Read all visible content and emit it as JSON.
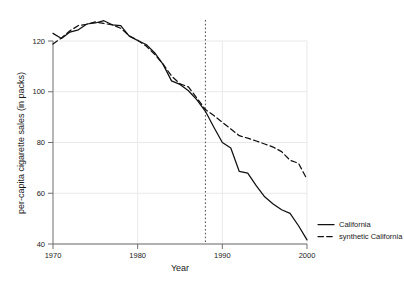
{
  "chart_data": {
    "type": "line",
    "title": "",
    "xlabel": "Year",
    "ylabel": "per-capita cigarette sales (in packs)",
    "xlim": [
      1970,
      2000
    ],
    "ylim": [
      40,
      130
    ],
    "xticks": [
      1970,
      1980,
      1990,
      2000
    ],
    "yticks": [
      40,
      60,
      80,
      100,
      120
    ],
    "grid": true,
    "legend_position": "right-bottom-outside",
    "x": [
      1970,
      1971,
      1972,
      1973,
      1974,
      1975,
      1976,
      1977,
      1978,
      1979,
      1980,
      1981,
      1982,
      1983,
      1984,
      1985,
      1986,
      1987,
      1988,
      1989,
      1990,
      1991,
      1992,
      1993,
      1994,
      1995,
      1996,
      1997,
      1998,
      1999,
      2000
    ],
    "series": [
      {
        "name": "California",
        "style": "solid",
        "color": "#111111",
        "values": [
          123.0,
          121.0,
          123.5,
          124.4,
          126.7,
          127.1,
          128.0,
          126.4,
          126.1,
          121.9,
          120.2,
          118.6,
          115.4,
          110.8,
          104.3,
          102.9,
          100.4,
          96.8,
          92.3,
          86.0,
          80.0,
          77.8,
          68.6,
          67.9,
          63.0,
          58.6,
          55.8,
          53.5,
          52.1,
          47.2,
          41.6
        ]
      },
      {
        "name": "synthetic California",
        "style": "dashed",
        "color": "#111111",
        "values": [
          118.8,
          121.2,
          124.0,
          126.1,
          126.6,
          127.5,
          126.9,
          126.4,
          125.0,
          122.1,
          120.3,
          118.0,
          114.8,
          110.9,
          106.2,
          103.1,
          101.9,
          97.5,
          93.0,
          90.6,
          88.0,
          85.3,
          82.7,
          81.7,
          80.6,
          79.4,
          78.2,
          76.4,
          73.0,
          71.8,
          65.5
        ]
      }
    ],
    "annotations": [
      {
        "type": "vline",
        "x": 1988,
        "style": "dotted",
        "label": "Passage of Proposition 99"
      }
    ]
  },
  "legend": {
    "items": [
      {
        "label": "California",
        "style": "solid"
      },
      {
        "label": "synthetic California",
        "style": "dashed"
      }
    ]
  }
}
